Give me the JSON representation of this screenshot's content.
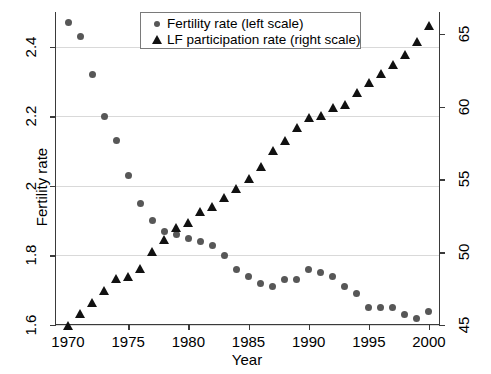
{
  "chart_data": {
    "type": "scatter",
    "title": "",
    "xlabel": "Year",
    "ylabel": "Fertility rate",
    "y2label": "Female LF participation rate",
    "xlim": [
      1969,
      2001
    ],
    "ylim": [
      1.6,
      2.5
    ],
    "y2lim": [
      45.0,
      66.5
    ],
    "grid": true,
    "legend_position": "top-center",
    "xticks": [
      1970,
      1975,
      1980,
      1985,
      1990,
      1995,
      2000
    ],
    "xtick_labels": [
      "1970",
      "1975",
      "1980",
      "1985",
      "1990",
      "1995",
      "2000"
    ],
    "yticks": [
      1.6,
      1.8,
      2.0,
      2.2,
      2.4
    ],
    "ytick_labels": [
      "1.6",
      "1.8",
      "2",
      "2.2",
      "2.4"
    ],
    "y2ticks": [
      45,
      50,
      55,
      60,
      65
    ],
    "y2tick_labels": [
      "45",
      "50",
      "55",
      "60",
      "65"
    ],
    "x": [
      1970,
      1971,
      1972,
      1973,
      1974,
      1975,
      1976,
      1977,
      1978,
      1979,
      1980,
      1981,
      1982,
      1983,
      1984,
      1985,
      1986,
      1987,
      1988,
      1989,
      1990,
      1991,
      1992,
      1993,
      1994,
      1995,
      1996,
      1997,
      1998,
      1999,
      2000
    ],
    "series": [
      {
        "name": "Fertility rate (left scale)",
        "axis": "left",
        "marker": "circle",
        "color": "#575757",
        "values": [
          2.47,
          2.43,
          2.32,
          2.2,
          2.13,
          2.03,
          1.95,
          1.9,
          1.87,
          1.86,
          1.85,
          1.84,
          1.83,
          1.8,
          1.76,
          1.74,
          1.72,
          1.71,
          1.73,
          1.73,
          1.76,
          1.75,
          1.74,
          1.71,
          1.69,
          1.65,
          1.65,
          1.65,
          1.63,
          1.62,
          1.64
        ]
      },
      {
        "name": "LF participation rate (right scale)",
        "axis": "right",
        "marker": "triangle",
        "color": "#111111",
        "values": [
          45.0,
          45.8,
          46.6,
          47.4,
          48.2,
          48.4,
          48.9,
          50.1,
          50.9,
          51.7,
          52.1,
          52.8,
          53.2,
          53.8,
          54.4,
          55.1,
          55.9,
          57.0,
          57.7,
          58.6,
          59.3,
          59.4,
          60.0,
          60.2,
          61.0,
          61.7,
          62.3,
          62.9,
          63.6,
          64.5,
          65.6
        ]
      }
    ]
  },
  "legend": {
    "items": [
      {
        "label": "Fertility rate (left scale)",
        "marker": "circle"
      },
      {
        "label": "LF participation rate (right scale)",
        "marker": "triangle"
      }
    ]
  },
  "axes": {
    "x_title": "Year",
    "y_left_title": "Fertility rate",
    "y_right_title": "Female LF participation rate"
  }
}
